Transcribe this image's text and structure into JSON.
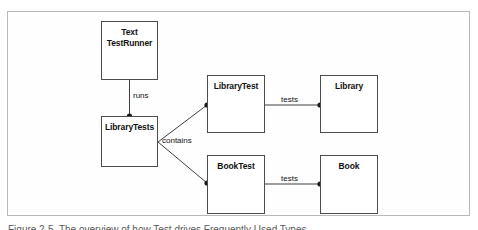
{
  "figure": {
    "background_color": "#ffffff",
    "frame_color": "#b9b9b9",
    "node_border_color": "#4d4d4d",
    "connector_color": "#3f3f3f",
    "caption": "Figure 2-5. The overview of how Test drives Frequently Used Types"
  },
  "diagram": {
    "type": "uml-class-diagram",
    "nodes": [
      {
        "id": "text-test-runner",
        "label": "Text\nTestRunner",
        "x": 101,
        "y": 21,
        "w": 57,
        "h": 59
      },
      {
        "id": "library-tests",
        "label": "LibraryTests",
        "x": 101,
        "y": 116,
        "w": 57,
        "h": 51
      },
      {
        "id": "library-test",
        "label": "LibraryTest",
        "x": 207,
        "y": 75,
        "w": 58,
        "h": 58
      },
      {
        "id": "library",
        "label": "Library",
        "x": 320,
        "y": 75,
        "w": 58,
        "h": 58
      },
      {
        "id": "book-test",
        "label": "BookTest",
        "x": 207,
        "y": 155,
        "w": 58,
        "h": 59
      },
      {
        "id": "book",
        "label": "Book",
        "x": 320,
        "y": 155,
        "w": 58,
        "h": 59
      }
    ],
    "edges": [
      {
        "id": "runs",
        "label": "runs",
        "from": "text-test-runner",
        "to": "library-tests",
        "label_x": 131,
        "label_y": 94
      },
      {
        "id": "contains-library",
        "label": "contains",
        "from": "library-tests",
        "to": "library-test",
        "label_x": 163,
        "label_y": 137
      },
      {
        "id": "contains-book",
        "label": "",
        "from": "library-tests",
        "to": "book-test",
        "label_x": 0,
        "label_y": 0
      },
      {
        "id": "tests-library",
        "label": "tests",
        "from": "library-test",
        "to": "library",
        "label_x": 283,
        "label_y": 96
      },
      {
        "id": "tests-book",
        "label": "tests",
        "from": "book-test",
        "to": "book",
        "label_x": 283,
        "label_y": 176
      }
    ],
    "labels": {
      "runs": "runs",
      "contains": "contains",
      "tests_library": "tests",
      "tests_book": "tests"
    }
  }
}
